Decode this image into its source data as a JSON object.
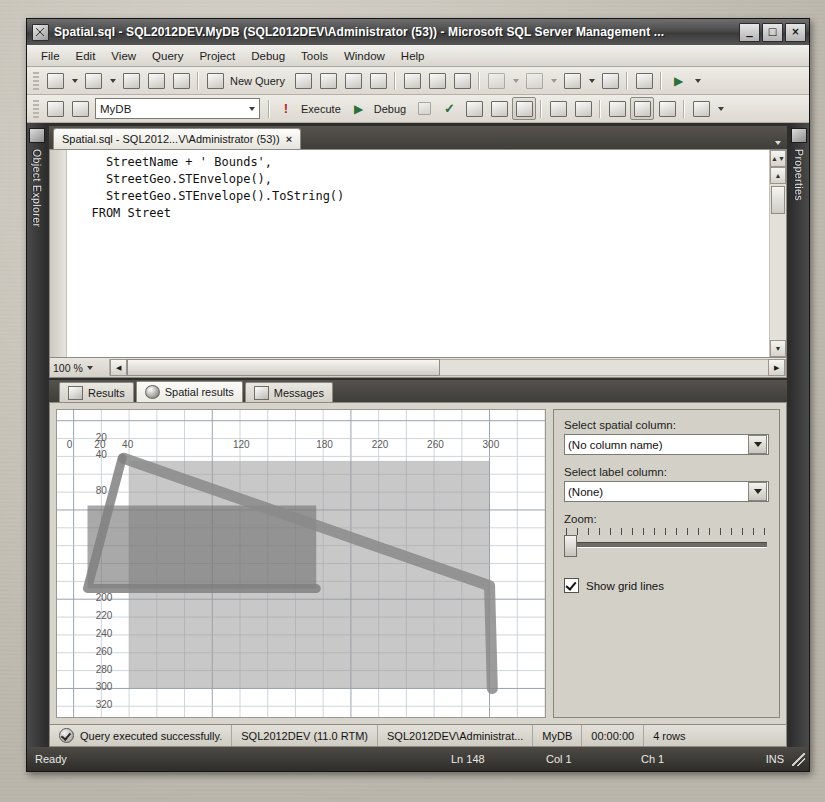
{
  "window": {
    "title": "Spatial.sql - SQL2012DEV.MyDB (SQL2012DEV\\Administrator (53)) - Microsoft SQL Server Management ...",
    "minimize": "_",
    "maximize": "□",
    "close": "×"
  },
  "menu": {
    "items": [
      {
        "label": "File"
      },
      {
        "label": "Edit"
      },
      {
        "label": "View"
      },
      {
        "label": "Query"
      },
      {
        "label": "Project"
      },
      {
        "label": "Debug"
      },
      {
        "label": "Tools"
      },
      {
        "label": "Window"
      },
      {
        "label": "Help"
      }
    ]
  },
  "toolbar1": {
    "new_query_label": "New Query"
  },
  "toolbar2": {
    "database": "MyDB",
    "execute_label": "Execute",
    "debug_label": "Debug"
  },
  "docktabs": {
    "left": "Object Explorer",
    "right": "Properties"
  },
  "document": {
    "tab_title": "Spatial.sql - SQL2012...V\\Administrator (53))",
    "close_label": "×",
    "code": "    StreetName + ' Bounds',\n    StreetGeo.STEnvelope(),\n    StreetGeo.STEnvelope().ToString()\n  FROM Street",
    "zoom_level": "100 %"
  },
  "results": {
    "tabs": [
      {
        "label": "Results",
        "icon": "grid-icon",
        "active": false
      },
      {
        "label": "Spatial results",
        "icon": "globe-icon",
        "active": true
      },
      {
        "label": "Messages",
        "icon": "document-icon",
        "active": false
      }
    ]
  },
  "spatial_panel": {
    "spatial_column_label": "Select spatial column:",
    "spatial_column_value": "(No column name)",
    "label_column_label": "Select label column:",
    "label_column_value": "(None)",
    "zoom_label": "Zoom:",
    "zoom_value": 0,
    "show_grid_lines_label": "Show grid lines",
    "show_grid_lines_checked": true
  },
  "chart_data": {
    "type": "scatter",
    "title": "Spatial results",
    "xlabel": "",
    "ylabel": "",
    "grid": true,
    "xlim": [
      -12,
      340
    ],
    "ylim": [
      -12,
      332
    ],
    "x_ticks": [
      0,
      20,
      40,
      120,
      180,
      220,
      260,
      300
    ],
    "y_ticks": [
      20,
      40,
      80,
      200,
      220,
      240,
      260,
      280,
      300,
      320
    ],
    "shapes": [
      {
        "name": "envelope-large",
        "type": "rectangle",
        "x0": 40,
        "y0": 45,
        "x1": 300,
        "y1": 300,
        "fill": "#9b9b9b",
        "opacity": 0.55
      },
      {
        "name": "envelope-small",
        "type": "rectangle",
        "x0": 10,
        "y0": 95,
        "x1": 175,
        "y1": 188,
        "fill": "#6f6f6f",
        "opacity": 0.6
      },
      {
        "name": "street-linestring",
        "type": "polyline",
        "points": [
          [
            36,
            42
          ],
          [
            300,
            185
          ],
          [
            302,
            300
          ]
        ],
        "stroke": "#8a8a8a",
        "width": 11
      },
      {
        "name": "street-linestring-2",
        "type": "polyline",
        "points": [
          [
            35,
            42
          ],
          [
            10,
            188
          ],
          [
            175,
            188
          ]
        ],
        "stroke": "#808080",
        "width": 9
      }
    ]
  },
  "results_status": {
    "message": "Query executed successfully.",
    "server": "SQL2012DEV (11.0 RTM)",
    "user": "SQL2012DEV\\Administrat...",
    "database": "MyDB",
    "elapsed": "00:00:00",
    "rows": "4 rows"
  },
  "app_status": {
    "state": "Ready",
    "line": "Ln 148",
    "col": "Col 1",
    "ch": "Ch 1",
    "insert_mode": "INS"
  }
}
